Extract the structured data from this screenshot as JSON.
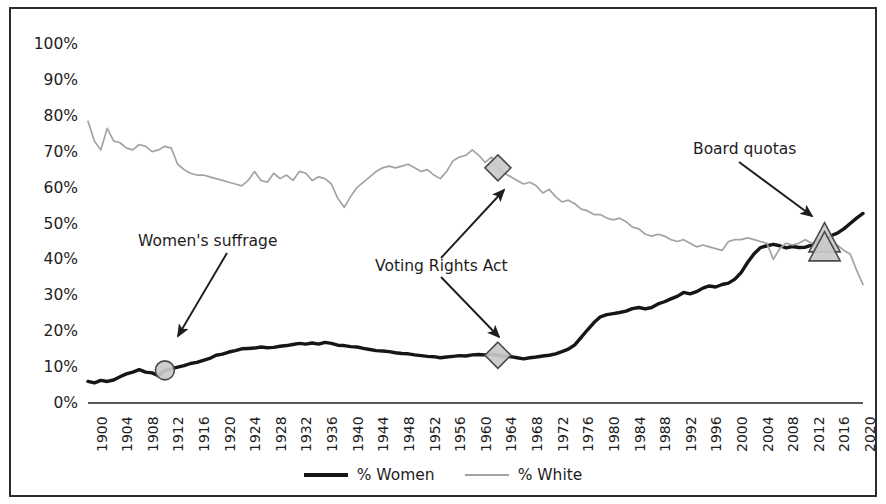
{
  "chart_data": {
    "type": "line",
    "title": "",
    "subtitle": "",
    "xlabel": "",
    "ylabel": "",
    "xlim": [
      1900,
      2021
    ],
    "ylim": [
      0,
      100
    ],
    "grid": false,
    "legend_position": "bottom-center",
    "y_ticks": [
      "0%",
      "10%",
      "20%",
      "30%",
      "40%",
      "50%",
      "60%",
      "70%",
      "80%",
      "90%",
      "100%"
    ],
    "y_tick_values": [
      0,
      10,
      20,
      30,
      40,
      50,
      60,
      70,
      80,
      90,
      100
    ],
    "x_ticks": [
      "1900",
      "1904",
      "1908",
      "1912",
      "1916",
      "1920",
      "1924",
      "1928",
      "1932",
      "1936",
      "1940",
      "1944",
      "1948",
      "1952",
      "1956",
      "1960",
      "1964",
      "1968",
      "1972",
      "1976",
      "1980",
      "1984",
      "1988",
      "1992",
      "1996",
      "2000",
      "2004",
      "2008",
      "2012",
      "2016",
      "2020"
    ],
    "x_tick_values": [
      1900,
      1904,
      1908,
      1912,
      1916,
      1920,
      1924,
      1928,
      1932,
      1936,
      1940,
      1944,
      1948,
      1952,
      1956,
      1960,
      1964,
      1968,
      1972,
      1976,
      1980,
      1984,
      1988,
      1992,
      1996,
      2000,
      2004,
      2008,
      2012,
      2016,
      2020
    ],
    "colors": {
      "women_line": "#161616",
      "white_line": "#a3a3a3",
      "marker_fill": "#c9c9c9",
      "marker_stroke": "#4a4a4a",
      "text": "#1d1d1d",
      "frame": "#2b2b2b",
      "background": "#ffffff"
    },
    "series": [
      {
        "name": "% Women",
        "color": "#161616",
        "x": [
          1900,
          1901,
          1902,
          1903,
          1904,
          1905,
          1906,
          1907,
          1908,
          1909,
          1910,
          1911,
          1912,
          1913,
          1914,
          1915,
          1916,
          1917,
          1918,
          1919,
          1920,
          1921,
          1922,
          1923,
          1924,
          1925,
          1926,
          1927,
          1928,
          1929,
          1930,
          1931,
          1932,
          1933,
          1934,
          1935,
          1936,
          1937,
          1938,
          1939,
          1940,
          1941,
          1942,
          1943,
          1944,
          1945,
          1946,
          1947,
          1948,
          1949,
          1950,
          1951,
          1952,
          1953,
          1954,
          1955,
          1956,
          1957,
          1958,
          1959,
          1960,
          1961,
          1962,
          1963,
          1964,
          1965,
          1966,
          1967,
          1968,
          1969,
          1970,
          1971,
          1972,
          1973,
          1974,
          1975,
          1976,
          1977,
          1978,
          1979,
          1980,
          1981,
          1982,
          1983,
          1984,
          1985,
          1986,
          1987,
          1988,
          1989,
          1990,
          1991,
          1992,
          1993,
          1994,
          1995,
          1996,
          1997,
          1998,
          1999,
          2000,
          2001,
          2002,
          2003,
          2004,
          2005,
          2006,
          2007,
          2008,
          2009,
          2010,
          2011,
          2012,
          2013,
          2014,
          2015,
          2016,
          2017,
          2018,
          2019,
          2020,
          2021
        ],
        "values": [
          6.0,
          5.6,
          6.3,
          6.0,
          6.4,
          7.3,
          8.1,
          8.6,
          9.3,
          8.6,
          8.4,
          7.6,
          9.1,
          9.5,
          10.0,
          10.4,
          11.0,
          11.3,
          11.9,
          12.4,
          13.3,
          13.6,
          14.2,
          14.6,
          15.1,
          15.2,
          15.3,
          15.6,
          15.4,
          15.5,
          15.8,
          16.0,
          16.3,
          16.6,
          16.4,
          16.7,
          16.4,
          16.9,
          16.6,
          16.1,
          16.0,
          15.7,
          15.6,
          15.2,
          14.9,
          14.6,
          14.5,
          14.3,
          14.0,
          13.8,
          13.7,
          13.4,
          13.2,
          13.0,
          12.9,
          12.6,
          12.8,
          13.0,
          13.2,
          13.1,
          13.4,
          13.5,
          13.4,
          13.6,
          13.3,
          13.1,
          12.9,
          12.6,
          12.3,
          12.6,
          12.8,
          13.1,
          13.3,
          13.7,
          14.3,
          15.0,
          16.2,
          18.3,
          20.4,
          22.4,
          24.0,
          24.6,
          24.9,
          25.2,
          25.6,
          26.3,
          26.6,
          26.2,
          26.6,
          27.6,
          28.2,
          29.0,
          29.7,
          30.8,
          30.4,
          31.0,
          32.0,
          32.6,
          32.3,
          33.0,
          33.4,
          34.5,
          36.4,
          39.2,
          41.6,
          43.3,
          43.8,
          44.2,
          43.8,
          43.2,
          43.6,
          43.3,
          43.4,
          44.0,
          45.2,
          45.5,
          46.6,
          47.3,
          48.5,
          50.0,
          51.5,
          52.8
        ],
        "marker_points": [
          {
            "year": 1912,
            "value": 9.1,
            "shape": "circle",
            "label": "Women's suffrage"
          },
          {
            "year": 1964,
            "value": 13.3,
            "shape": "diamond",
            "label": "Voting Rights Act"
          },
          {
            "year": 2015,
            "value": 45.5,
            "shape": "triangle",
            "label": "Board quotas"
          }
        ]
      },
      {
        "name": "% White",
        "color": "#a3a3a3",
        "x": [
          1900,
          1901,
          1902,
          1903,
          1904,
          1905,
          1906,
          1907,
          1908,
          1909,
          1910,
          1911,
          1912,
          1913,
          1914,
          1915,
          1916,
          1917,
          1918,
          1919,
          1920,
          1921,
          1922,
          1923,
          1924,
          1925,
          1926,
          1927,
          1928,
          1929,
          1930,
          1931,
          1932,
          1933,
          1934,
          1935,
          1936,
          1937,
          1938,
          1939,
          1940,
          1941,
          1942,
          1943,
          1944,
          1945,
          1946,
          1947,
          1948,
          1949,
          1950,
          1951,
          1952,
          1953,
          1954,
          1955,
          1956,
          1957,
          1958,
          1959,
          1960,
          1961,
          1962,
          1963,
          1964,
          1965,
          1966,
          1967,
          1968,
          1969,
          1970,
          1971,
          1972,
          1973,
          1974,
          1975,
          1976,
          1977,
          1978,
          1979,
          1980,
          1981,
          1982,
          1983,
          1984,
          1985,
          1986,
          1987,
          1988,
          1989,
          1990,
          1991,
          1992,
          1993,
          1994,
          1995,
          1996,
          1997,
          1998,
          1999,
          2000,
          2001,
          2002,
          2003,
          2004,
          2005,
          2006,
          2007,
          2008,
          2009,
          2010,
          2011,
          2012,
          2013,
          2014,
          2015,
          2016,
          2017,
          2018,
          2019,
          2020,
          2021
        ],
        "values": [
          78.5,
          73.0,
          70.5,
          76.5,
          73.0,
          72.5,
          71.0,
          70.5,
          72.0,
          71.5,
          70.0,
          70.5,
          71.5,
          71.0,
          66.5,
          65.0,
          64.0,
          63.5,
          63.5,
          63.0,
          62.5,
          62.0,
          61.5,
          61.0,
          60.5,
          62.0,
          64.5,
          62.0,
          61.5,
          64.0,
          62.5,
          63.5,
          62.0,
          64.5,
          64.0,
          62.0,
          63.0,
          62.5,
          61.0,
          57.0,
          54.5,
          57.5,
          60.0,
          61.5,
          63.0,
          64.5,
          65.5,
          66.0,
          65.5,
          66.0,
          66.5,
          65.5,
          64.5,
          65.0,
          63.5,
          62.5,
          64.5,
          67.5,
          68.5,
          69.0,
          70.5,
          69.0,
          67.0,
          68.5,
          65.5,
          64.0,
          63.0,
          62.0,
          61.0,
          61.5,
          60.5,
          58.5,
          59.5,
          57.5,
          56.0,
          56.5,
          55.5,
          54.0,
          53.5,
          52.5,
          52.5,
          51.5,
          51.0,
          51.5,
          50.5,
          49.0,
          48.5,
          47.0,
          46.5,
          47.0,
          46.5,
          45.5,
          45.0,
          45.5,
          44.5,
          43.5,
          44.0,
          43.5,
          43.0,
          42.5,
          45.0,
          45.5,
          45.5,
          46.0,
          45.5,
          45.0,
          44.5,
          40.0,
          43.0,
          44.5,
          44.0,
          44.5,
          45.5,
          44.5,
          45.0,
          44.0,
          43.5,
          44.0,
          42.5,
          41.5,
          37.0,
          33.0
        ],
        "marker_points": [
          {
            "year": 1964,
            "value": 65.5,
            "shape": "diamond",
            "label": "Voting Rights Act"
          },
          {
            "year": 2015,
            "value": 43.0,
            "shape": "triangle",
            "label": "Board quotas"
          }
        ]
      }
    ],
    "annotations": [
      {
        "id": "womens-suffrage",
        "text": "Women's suffrage",
        "target_year": 1912,
        "target_value": 9.1
      },
      {
        "id": "voting-rights-act",
        "text": "Voting Rights Act",
        "target_year": 1964,
        "target_value": 65.5
      },
      {
        "id": "board-quotas",
        "text": "Board quotas",
        "target_year": 2015,
        "target_value": 45.5
      }
    ],
    "legend": [
      {
        "label": "% Women",
        "style": "thick-black-line"
      },
      {
        "label": "% White",
        "style": "thin-gray-line"
      }
    ]
  }
}
